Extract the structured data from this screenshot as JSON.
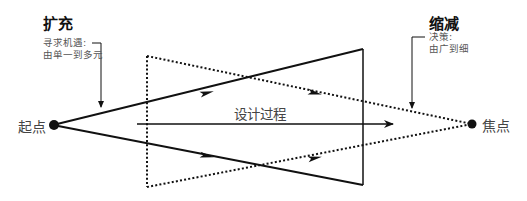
{
  "diagram": {
    "type": "double-diamond-half",
    "labels": {
      "expand_title": "扩充",
      "expand_caption_line1": "寻求机遇:",
      "expand_caption_line2": "由单一到多元",
      "reduce_title": "缩减",
      "reduce_caption_line1": "决策:",
      "reduce_caption_line2": "由广到细",
      "start_point": "起点",
      "focus_point": "焦点",
      "process": "设计过程"
    },
    "colors": {
      "stroke": "#111111",
      "text": "#444444",
      "background": "#ffffff"
    },
    "nodes": [
      {
        "id": "start",
        "label": "起点",
        "x": 53,
        "y": 125
      },
      {
        "id": "focus",
        "label": "焦点",
        "x": 472,
        "y": 124
      }
    ],
    "shapes": [
      {
        "name": "divergent-triangle",
        "style": "solid",
        "points": [
          [
            53,
            125
          ],
          [
            363,
            49
          ],
          [
            363,
            185
          ]
        ]
      },
      {
        "name": "convergent-triangle",
        "style": "dotted",
        "points": [
          [
            147,
            56
          ],
          [
            472,
            124
          ],
          [
            147,
            187
          ]
        ]
      }
    ],
    "arrows": [
      {
        "name": "design-process-arrow",
        "from": [
          137,
          124
        ],
        "to": [
          393,
          124
        ]
      }
    ]
  }
}
